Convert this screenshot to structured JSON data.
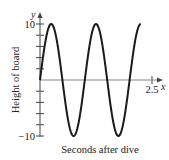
{
  "chart_data": {
    "type": "line",
    "title": "",
    "xlabel": "Seconds after dive",
    "ylabel": "Height of board",
    "x_axis_letter": "x",
    "y_axis_letter": "y",
    "xlim": [
      0,
      2.5
    ],
    "ylim": [
      -10,
      10
    ],
    "x_ticks": [
      {
        "value": 2.5,
        "label": "2.5"
      }
    ],
    "y_ticks": [
      {
        "value": 10,
        "label": "10"
      },
      {
        "value": 8,
        "label": ""
      },
      {
        "value": 6,
        "label": ""
      },
      {
        "value": 4,
        "label": ""
      },
      {
        "value": 2,
        "label": ""
      },
      {
        "value": -2,
        "label": ""
      },
      {
        "value": -4,
        "label": ""
      },
      {
        "value": -6,
        "label": ""
      },
      {
        "value": -8,
        "label": ""
      },
      {
        "value": -10,
        "label": "−10"
      }
    ],
    "grid": false,
    "series": [
      {
        "name": "height",
        "function": "10*sin(2*pi*t)",
        "amplitude": 10,
        "period": 1,
        "t_range": [
          0,
          2.25
        ],
        "key_points": [
          {
            "x": 0,
            "y": 0
          },
          {
            "x": 0.25,
            "y": 10
          },
          {
            "x": 0.5,
            "y": 0
          },
          {
            "x": 0.75,
            "y": -10
          },
          {
            "x": 1.0,
            "y": 0
          },
          {
            "x": 1.25,
            "y": 10
          },
          {
            "x": 1.5,
            "y": 0
          },
          {
            "x": 1.75,
            "y": -10
          },
          {
            "x": 2.0,
            "y": 0
          },
          {
            "x": 2.25,
            "y": 10
          }
        ]
      }
    ]
  }
}
